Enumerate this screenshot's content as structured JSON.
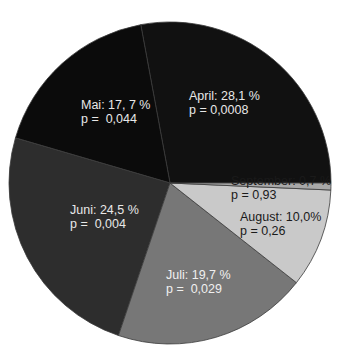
{
  "chart_data": {
    "type": "pie",
    "title": "",
    "start_angle_deg": 0,
    "direction": "counterclockwise",
    "slices": [
      {
        "label": "April",
        "value": 28.1,
        "text": "April: 28,1 %",
        "p_text": "p = 0,0008",
        "color": "#111111",
        "text_color": "#e8e8e8",
        "lx": 189,
        "ly": 89
      },
      {
        "label": "Mai",
        "value": 17.7,
        "text": "Mai: 17, 7 %",
        "p_text": "p =  0,044",
        "color": "#0b0b0b",
        "text_color": "#e8e8e8",
        "lx": 81,
        "ly": 98
      },
      {
        "label": "Juni",
        "value": 24.5,
        "text": "Juni: 24,5 %",
        "p_text": "p =  0,004",
        "color": "#2d2d2d",
        "text_color": "#e8e8e8",
        "lx": 70,
        "ly": 203
      },
      {
        "label": "Juli",
        "value": 19.7,
        "text": "Juli: 19,7 %",
        "p_text": "p =  0,029",
        "color": "#777777",
        "text_color": "#f0f0f0",
        "lx": 166,
        "ly": 268
      },
      {
        "label": "August",
        "value": 10.0,
        "text": "August: 10,0%",
        "p_text": "p = 0,26",
        "color": "#c9c9c9",
        "text_color": "#1a1a1a",
        "lx": 240,
        "ly": 210
      },
      {
        "label": "September",
        "value": 0.7,
        "text": "September: 0,7 %",
        "p_text": "p = 0,93",
        "color": "#a8a8a8",
        "text_color": "#1a1a1a",
        "lx": 231,
        "ly": 174
      }
    ],
    "center": [
      170,
      183
    ],
    "radius": 161,
    "legend": "none"
  }
}
